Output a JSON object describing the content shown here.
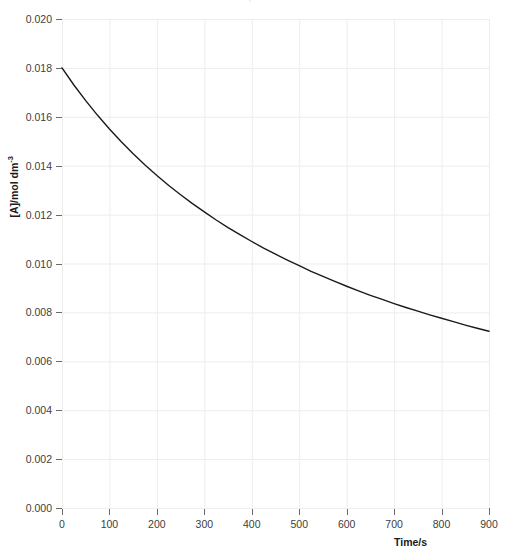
{
  "figure": {
    "background_color": "#ffffff",
    "top_clipped_caption": "· ,                                                                                                  ·   ·",
    "axis_color": "#6b6b6b",
    "grid_color": "#ededed",
    "text_color": "#404040"
  },
  "chart_data": {
    "type": "line",
    "title": "",
    "subtitle": "",
    "xlabel": "Time/s",
    "ylabel": "[A]/mol dm",
    "ylabel_exponent": "-3",
    "xlim": [
      0,
      900
    ],
    "ylim": [
      0.0,
      0.02
    ],
    "grid": true,
    "grid_style": "solid",
    "legend": false,
    "legend_position": "none",
    "xticks": [
      0,
      100,
      200,
      300,
      400,
      500,
      600,
      700,
      800,
      900
    ],
    "xticklabels": [
      "0",
      "100",
      "200",
      "300",
      "400",
      "500",
      "600",
      "700",
      "800",
      "900"
    ],
    "yticks": [
      0.0,
      0.002,
      0.004,
      0.006,
      0.008,
      0.01,
      0.012,
      0.014,
      0.016,
      0.018,
      0.02
    ],
    "yticklabels": [
      "0.000",
      "0.002",
      "0.004",
      "0.006",
      "0.008",
      "0.010",
      "0.012",
      "0.014",
      "0.016",
      "0.018",
      "0.020"
    ],
    "series": [
      {
        "name": "[A]",
        "color": "#1a1a1a",
        "linewidth": 1.4,
        "x": [
          0,
          25,
          50,
          75,
          100,
          125,
          150,
          175,
          200,
          225,
          250,
          275,
          300,
          325,
          350,
          375,
          400,
          425,
          450,
          475,
          500,
          525,
          550,
          575,
          600,
          625,
          650,
          675,
          700,
          725,
          750,
          775,
          800,
          825,
          850,
          875,
          900
        ],
        "y": [
          0.018,
          0.0173,
          0.01666,
          0.01606,
          0.0155,
          0.01498,
          0.01449,
          0.01403,
          0.0136,
          0.01319,
          0.01281,
          0.01245,
          0.01211,
          0.01178,
          0.01147,
          0.01118,
          0.0109,
          0.01063,
          0.01038,
          0.01014,
          0.00991,
          0.00968,
          0.00947,
          0.00927,
          0.00907,
          0.00888,
          0.0087,
          0.00853,
          0.00836,
          0.0082,
          0.00805,
          0.0079,
          0.00776,
          0.00762,
          0.00748,
          0.00735,
          0.00723
        ]
      }
    ],
    "annotations": []
  }
}
